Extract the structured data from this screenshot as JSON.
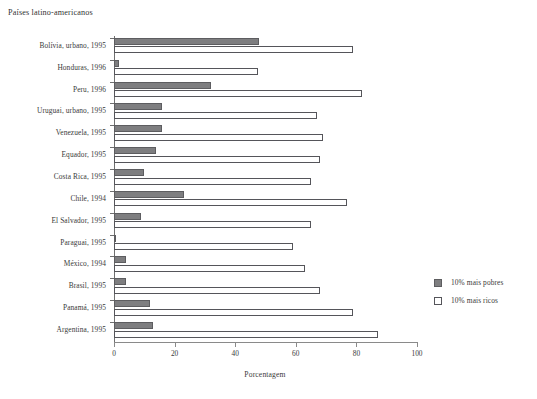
{
  "chart_data": {
    "type": "bar",
    "orientation": "horizontal",
    "title": "Países latino-americanos",
    "xlabel": "Porcentagem",
    "ylabel": "",
    "xlim": [
      0,
      100
    ],
    "xticks": [
      0,
      20,
      40,
      60,
      80,
      100
    ],
    "grid": false,
    "legend_position": "right",
    "categories": [
      "Bolívia, urbano, 1995",
      "Honduras, 1996",
      "Peru, 1996",
      "Uruguai, urbano, 1995",
      "Venezuela, 1995",
      "Equador, 1995",
      "Costa Rica, 1995",
      "Chile, 1994",
      "El Salvador, 1995",
      "Paraguai, 1995",
      "México, 1994",
      "Brasil, 1995",
      "Panamá, 1995",
      "Argentina, 1995"
    ],
    "series": [
      {
        "name": "10% mais pobres",
        "color": "#7e7e80",
        "values": [
          48,
          1.5,
          32,
          16,
          16,
          14,
          10,
          23,
          9,
          0.3,
          4,
          4,
          12,
          13
        ]
      },
      {
        "name": "10% mais ricos",
        "color": "#ffffff",
        "values": [
          79,
          47.5,
          82,
          67,
          69,
          68,
          65,
          77,
          65,
          59,
          63,
          68,
          79,
          87
        ]
      }
    ]
  },
  "legend": {
    "items": [
      {
        "label": "10% mais pobres",
        "swatch": "filled-gray"
      },
      {
        "label": "10% mais ricos",
        "swatch": "open-white"
      }
    ]
  },
  "axis": {
    "x_tick_labels": [
      "0",
      "20",
      "40",
      "60",
      "80",
      "100"
    ],
    "x_title": "Porcentagem"
  }
}
